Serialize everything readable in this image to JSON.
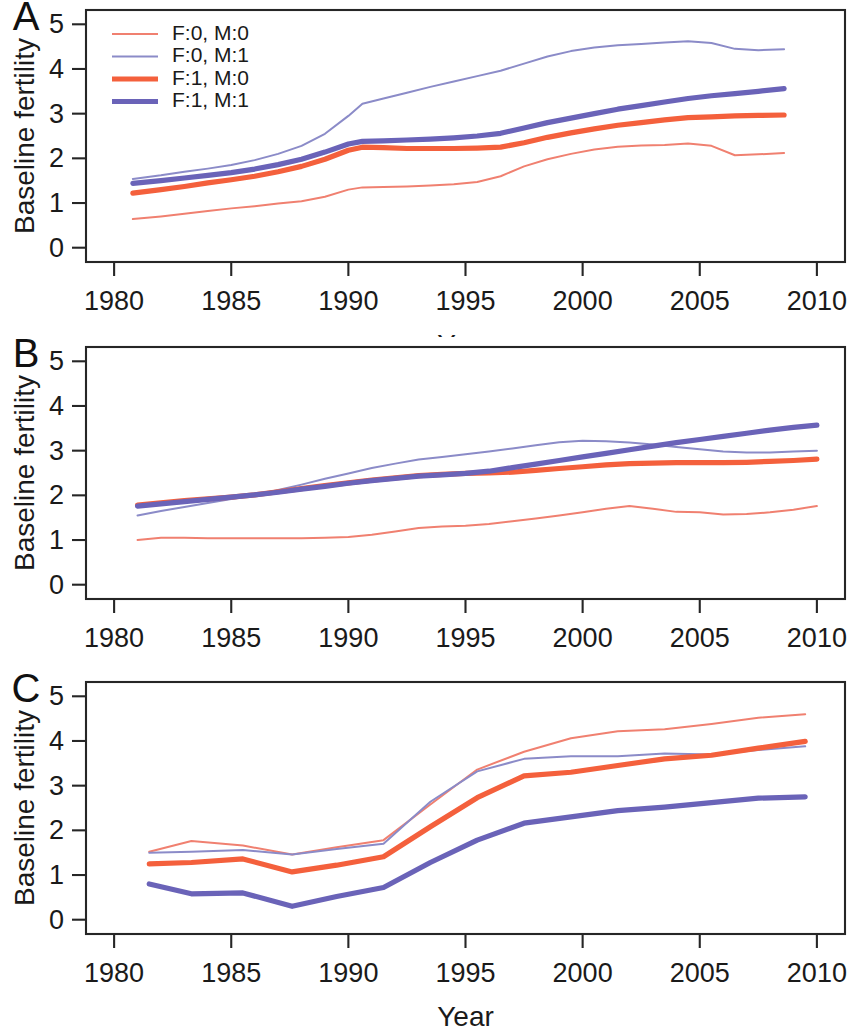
{
  "figure": {
    "background": "#ffffff",
    "axis_color": "#262626",
    "panels": [
      "A",
      "B",
      "C"
    ]
  },
  "legend": {
    "position": "top-left of panel A",
    "entries": [
      {
        "label": "F:0, M:0",
        "color": "#f08070",
        "width": 2.0
      },
      {
        "label": "F:0, M:1",
        "color": "#8b8bc8",
        "width": 2.0
      },
      {
        "label": "F:1, M:0",
        "color": "#f4603c",
        "width": 5.2
      },
      {
        "label": "F:1, M:1",
        "color": "#6a63b8",
        "width": 5.2
      }
    ]
  },
  "axes": {
    "xlabel": "Year",
    "ylabel": "Baseline fertility",
    "xticks": [
      1980,
      1985,
      1990,
      1995,
      2000,
      2005,
      2010
    ],
    "xtick_labels": [
      "1980",
      "1985",
      "1990",
      "1995",
      "2000",
      "2005",
      "2010"
    ],
    "yticks": [
      0,
      1,
      2,
      3,
      4,
      5
    ],
    "ytick_labels": [
      "0",
      "1",
      "2",
      "3",
      "4",
      "5"
    ],
    "xlim": [
      1978.8,
      2011.2
    ],
    "ylim": [
      -0.32,
      5.32
    ],
    "grid": false
  },
  "chart_data": [
    {
      "type": "line",
      "panel": "A",
      "title": "",
      "xlabel": "Year",
      "ylabel": "Baseline fertility",
      "xlim": [
        1978.8,
        2011.2
      ],
      "ylim": [
        -0.32,
        5.32
      ],
      "grid": false,
      "legend_position": "upper left",
      "x": [
        1980.8,
        1982,
        1983,
        1984,
        1985,
        1986,
        1987,
        1988,
        1989,
        1990,
        1990.6,
        1991.5,
        1992.5,
        1993.5,
        1994.5,
        1995.5,
        1996.5,
        1997.5,
        1998.5,
        1999.5,
        2000.5,
        2001.5,
        2002.5,
        2003.5,
        2004.5,
        2005.5,
        2006.5,
        2007.5,
        2008.6
      ],
      "series": [
        {
          "name": "F:0, M:0",
          "color": "#f08070",
          "width": 2.0,
          "values": [
            0.64,
            0.7,
            0.76,
            0.82,
            0.88,
            0.93,
            0.99,
            1.04,
            1.14,
            1.3,
            1.35,
            1.36,
            1.37,
            1.39,
            1.42,
            1.47,
            1.6,
            1.82,
            1.98,
            2.1,
            2.2,
            2.26,
            2.29,
            2.3,
            2.33,
            2.28,
            2.07,
            2.09,
            2.12
          ]
        },
        {
          "name": "F:0, M:1",
          "color": "#8b8bc8",
          "width": 2.0,
          "values": [
            1.54,
            1.62,
            1.7,
            1.77,
            1.85,
            1.96,
            2.1,
            2.28,
            2.55,
            2.95,
            3.22,
            3.34,
            3.47,
            3.6,
            3.72,
            3.84,
            3.96,
            4.12,
            4.28,
            4.4,
            4.48,
            4.53,
            4.56,
            4.59,
            4.62,
            4.58,
            4.45,
            4.42,
            4.44
          ]
        },
        {
          "name": "F:1, M:0",
          "color": "#f4603c",
          "width": 5.2,
          "values": [
            1.22,
            1.3,
            1.37,
            1.45,
            1.52,
            1.6,
            1.7,
            1.82,
            1.98,
            2.18,
            2.25,
            2.24,
            2.22,
            2.22,
            2.22,
            2.23,
            2.25,
            2.35,
            2.47,
            2.57,
            2.66,
            2.74,
            2.8,
            2.86,
            2.91,
            2.93,
            2.95,
            2.96,
            2.97
          ]
        },
        {
          "name": "F:1, M:1",
          "color": "#6a63b8",
          "width": 5.2,
          "values": [
            1.44,
            1.5,
            1.56,
            1.62,
            1.68,
            1.76,
            1.86,
            1.98,
            2.14,
            2.32,
            2.38,
            2.39,
            2.41,
            2.43,
            2.46,
            2.5,
            2.56,
            2.68,
            2.8,
            2.9,
            3.0,
            3.1,
            3.18,
            3.26,
            3.34,
            3.4,
            3.45,
            3.5,
            3.56
          ]
        }
      ]
    },
    {
      "type": "line",
      "panel": "B",
      "title": "",
      "xlabel": "Year",
      "ylabel": "Baseline fertility",
      "xlim": [
        1978.8,
        2011.2
      ],
      "ylim": [
        -0.32,
        5.32
      ],
      "grid": false,
      "legend_position": "none",
      "x": [
        1981,
        1982,
        1983,
        1984,
        1985,
        1986,
        1987,
        1988,
        1989,
        1990,
        1991,
        1992,
        1993,
        1994,
        1995,
        1996,
        1997,
        1998,
        1999,
        2000,
        2001,
        2002,
        2003,
        2004,
        2005,
        2006,
        2007,
        2008,
        2009,
        2010
      ],
      "series": [
        {
          "name": "F:0, M:0",
          "color": "#f08070",
          "width": 2.0,
          "values": [
            1.0,
            1.05,
            1.05,
            1.04,
            1.04,
            1.04,
            1.04,
            1.04,
            1.05,
            1.07,
            1.12,
            1.19,
            1.27,
            1.3,
            1.32,
            1.36,
            1.42,
            1.48,
            1.55,
            1.62,
            1.7,
            1.76,
            1.7,
            1.63,
            1.62,
            1.57,
            1.58,
            1.62,
            1.68,
            1.76
          ]
        },
        {
          "name": "F:0, M:1",
          "color": "#8b8bc8",
          "width": 2.0,
          "values": [
            1.55,
            1.65,
            1.74,
            1.83,
            1.92,
            2.0,
            2.12,
            2.24,
            2.37,
            2.49,
            2.61,
            2.71,
            2.8,
            2.86,
            2.92,
            2.98,
            3.05,
            3.12,
            3.19,
            3.22,
            3.21,
            3.18,
            3.14,
            3.08,
            3.03,
            2.98,
            2.96,
            2.96,
            2.98,
            3.0
          ]
        },
        {
          "name": "F:1, M:0",
          "color": "#f4603c",
          "width": 5.2,
          "values": [
            1.78,
            1.83,
            1.88,
            1.92,
            1.96,
            2.01,
            2.08,
            2.15,
            2.22,
            2.28,
            2.34,
            2.39,
            2.44,
            2.47,
            2.49,
            2.5,
            2.52,
            2.56,
            2.6,
            2.64,
            2.68,
            2.71,
            2.72,
            2.73,
            2.73,
            2.73,
            2.74,
            2.76,
            2.78,
            2.81
          ]
        },
        {
          "name": "F:1, M:1",
          "color": "#6a63b8",
          "width": 5.2,
          "values": [
            1.76,
            1.81,
            1.86,
            1.91,
            1.96,
            2.01,
            2.07,
            2.14,
            2.2,
            2.27,
            2.33,
            2.38,
            2.43,
            2.46,
            2.49,
            2.54,
            2.62,
            2.7,
            2.78,
            2.86,
            2.94,
            3.02,
            3.1,
            3.18,
            3.25,
            3.32,
            3.39,
            3.46,
            3.52,
            3.57
          ]
        }
      ]
    },
    {
      "type": "line",
      "panel": "C",
      "title": "",
      "xlabel": "Year",
      "ylabel": "Baseline fertility",
      "xlim": [
        1978.8,
        2011.2
      ],
      "ylim": [
        -0.32,
        5.32
      ],
      "grid": false,
      "legend_position": "none",
      "x": [
        1981.5,
        1983.3,
        1985.5,
        1987.6,
        1989.5,
        1991.5,
        1993.5,
        1995.5,
        1997.5,
        1999.5,
        2001.5,
        2003.5,
        2005.5,
        2007.5,
        2009.5
      ],
      "series": [
        {
          "name": "F:0, M:0",
          "color": "#f08070",
          "width": 2.0,
          "values": [
            1.52,
            1.76,
            1.66,
            1.46,
            1.62,
            1.78,
            2.58,
            3.36,
            3.76,
            4.06,
            4.22,
            4.26,
            4.38,
            4.52,
            4.6
          ]
        },
        {
          "name": "F:0, M:1",
          "color": "#8b8bc8",
          "width": 2.0,
          "values": [
            1.5,
            1.52,
            1.56,
            1.46,
            1.58,
            1.7,
            2.64,
            3.32,
            3.6,
            3.66,
            3.66,
            3.72,
            3.7,
            3.8,
            3.88
          ]
        },
        {
          "name": "F:1, M:0",
          "color": "#f4603c",
          "width": 5.2,
          "values": [
            1.25,
            1.28,
            1.36,
            1.07,
            1.22,
            1.41,
            2.08,
            2.73,
            3.22,
            3.3,
            3.45,
            3.6,
            3.68,
            3.84,
            3.99
          ]
        },
        {
          "name": "F:1, M:1",
          "color": "#6a63b8",
          "width": 5.2,
          "values": [
            0.8,
            0.58,
            0.6,
            0.3,
            0.52,
            0.72,
            1.28,
            1.78,
            2.16,
            2.3,
            2.44,
            2.52,
            2.62,
            2.72,
            2.75
          ]
        }
      ]
    }
  ]
}
